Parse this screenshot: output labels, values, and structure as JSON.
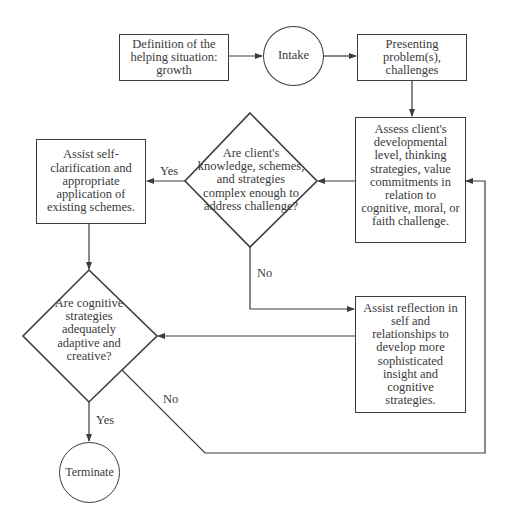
{
  "diagram": {
    "nodes": {
      "definition": {
        "shape": "rectangle",
        "text": "Definition of the helping situation: growth"
      },
      "intake": {
        "shape": "circle",
        "text": "Intake"
      },
      "presenting": {
        "shape": "rectangle",
        "text": "Presenting problem(s), challenges"
      },
      "assess": {
        "shape": "rectangle",
        "text": "Assess client's developmental level, thinking strategies, value commitments in relation to cognitive, moral, or faith challenge."
      },
      "decision_complex": {
        "shape": "diamond",
        "text": "Are client's knowledge, schemes, and strategies complex enough to address challenge?"
      },
      "assist_self": {
        "shape": "rectangle",
        "text": "Assist self-clarification and appropriate application of existing schemes."
      },
      "decision_adaptive": {
        "shape": "diamond",
        "text": "Are cognitive strategies adequately adaptive and creative?"
      },
      "assist_reflection": {
        "shape": "rectangle",
        "text": "Assist reflection in self and relationships to develop more sophisticated insight and cognitive strategies."
      },
      "terminate": {
        "shape": "circle",
        "text": "Terminate"
      }
    },
    "edge_labels": {
      "complex_yes": "Yes",
      "complex_no": "No",
      "adaptive_yes": "Yes",
      "adaptive_no": "No"
    },
    "edges": [
      {
        "from": "definition",
        "to": "intake"
      },
      {
        "from": "intake",
        "to": "presenting"
      },
      {
        "from": "presenting",
        "to": "assess"
      },
      {
        "from": "assess",
        "to": "decision_complex"
      },
      {
        "from": "decision_complex",
        "to": "assist_self",
        "label": "Yes"
      },
      {
        "from": "decision_complex",
        "to": "assist_reflection",
        "label": "No"
      },
      {
        "from": "assist_self",
        "to": "decision_adaptive"
      },
      {
        "from": "assist_reflection",
        "to": "decision_adaptive"
      },
      {
        "from": "decision_adaptive",
        "to": "terminate",
        "label": "Yes"
      },
      {
        "from": "decision_adaptive",
        "to": "assess",
        "label": "No"
      }
    ]
  }
}
